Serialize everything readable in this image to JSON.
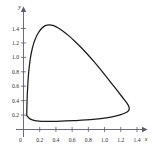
{
  "chart_data": {
    "type": "line",
    "title": "",
    "subtitle": "",
    "xlabel": "x",
    "ylabel": "y",
    "xlim": [
      0,
      1.55
    ],
    "ylim": [
      0,
      1.58
    ],
    "grid": false,
    "legend": null,
    "origin_label": "0",
    "xticks": [
      0.2,
      0.4,
      0.6,
      0.8,
      1.0,
      1.2,
      1.4
    ],
    "xtick_labels": [
      "0.2",
      "0.4",
      "0.6",
      "0.8",
      "1.0",
      "1.2",
      "1.4"
    ],
    "yticks": [
      0.2,
      0.4,
      0.6,
      0.8,
      1.0,
      1.2,
      1.4
    ],
    "ytick_labels": [
      "0.2",
      "0.4",
      "0.6",
      "0.8",
      "1.0",
      "1.2",
      "1.4"
    ],
    "series": [
      {
        "name": "closed orbit",
        "closed": true,
        "color": "#1b1b1b",
        "points": [
          [
            0.04,
            0.2
          ],
          [
            0.042,
            0.32
          ],
          [
            0.046,
            0.46
          ],
          [
            0.052,
            0.6
          ],
          [
            0.06,
            0.74
          ],
          [
            0.072,
            0.88
          ],
          [
            0.088,
            1.01
          ],
          [
            0.11,
            1.13
          ],
          [
            0.14,
            1.24
          ],
          [
            0.178,
            1.33
          ],
          [
            0.222,
            1.4
          ],
          [
            0.268,
            1.44
          ],
          [
            0.318,
            1.452
          ],
          [
            0.372,
            1.44
          ],
          [
            0.43,
            1.408
          ],
          [
            0.492,
            1.36
          ],
          [
            0.56,
            1.298
          ],
          [
            0.632,
            1.224
          ],
          [
            0.708,
            1.14
          ],
          [
            0.786,
            1.046
          ],
          [
            0.864,
            0.948
          ],
          [
            0.942,
            0.844
          ],
          [
            1.016,
            0.74
          ],
          [
            1.086,
            0.64
          ],
          [
            1.15,
            0.548
          ],
          [
            1.206,
            0.468
          ],
          [
            1.25,
            0.404
          ],
          [
            1.282,
            0.356
          ],
          [
            1.3,
            0.316
          ],
          [
            1.304,
            0.286
          ],
          [
            1.296,
            0.262
          ],
          [
            1.272,
            0.24
          ],
          [
            1.23,
            0.218
          ],
          [
            1.17,
            0.196
          ],
          [
            1.092,
            0.176
          ],
          [
            0.998,
            0.158
          ],
          [
            0.89,
            0.144
          ],
          [
            0.772,
            0.132
          ],
          [
            0.648,
            0.124
          ],
          [
            0.524,
            0.118
          ],
          [
            0.408,
            0.114
          ],
          [
            0.306,
            0.112
          ],
          [
            0.224,
            0.114
          ],
          [
            0.162,
            0.12
          ],
          [
            0.118,
            0.13
          ],
          [
            0.086,
            0.144
          ],
          [
            0.066,
            0.16
          ],
          [
            0.052,
            0.178
          ],
          [
            0.044,
            0.19
          ]
        ]
      }
    ]
  },
  "figure": {
    "background_color": "#ffffff",
    "axis_color": "#5a5a6a",
    "curve_color": "#1b1b1b"
  }
}
